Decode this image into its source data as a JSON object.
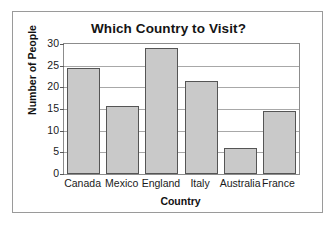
{
  "chart_data": {
    "type": "bar",
    "title": "Which Country to Visit?",
    "xlabel": "Country",
    "ylabel": "Number of People",
    "categories": [
      "Canada",
      "Mexico",
      "England",
      "Italy",
      "Australia",
      "France"
    ],
    "values": [
      24.5,
      15.7,
      29,
      21.5,
      6,
      14.5
    ],
    "ylim": [
      0,
      30
    ],
    "yticks": [
      0,
      5,
      10,
      15,
      20,
      25,
      30
    ],
    "grid": "horizontal",
    "legend": "none",
    "bar_fill_color": "#c9c9c9",
    "bar_edge_color": "#555555",
    "gridline_color": "#a8a8a8",
    "frame_color": "#9a9a9a"
  }
}
